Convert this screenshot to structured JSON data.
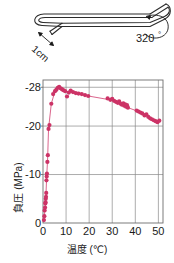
{
  "figure": {
    "schematic": {
      "name": "bent-capillary-tube-schematic",
      "length_label": "1cm",
      "angle_label": "320°",
      "outline_color": "#2b2b2b",
      "fill_color": "#fbfbfb"
    }
  },
  "chart_data": {
    "type": "scatter",
    "title": "",
    "xlabel": "温度 (℃)",
    "ylabel": "負圧 (MPa)",
    "xlim": [
      0,
      52
    ],
    "ylim": [
      0,
      -29.5
    ],
    "xticks": [
      0,
      10,
      20,
      30,
      40,
      50
    ],
    "xticklabels": [
      "0",
      "10",
      "20",
      "30",
      "40",
      "50"
    ],
    "yticks": [
      0,
      -10,
      -20,
      -28
    ],
    "yticklabels": [
      "0",
      "-10",
      "-20",
      "-28"
    ],
    "grid": true,
    "marker_color": "#cc3366",
    "line_color": "#d6547f",
    "series": [
      {
        "name": "負圧",
        "points": [
          [
            0.4,
            -0.6
          ],
          [
            0.6,
            -1.4
          ],
          [
            0.7,
            -2.6
          ],
          [
            0.9,
            -3.2
          ],
          [
            1.0,
            -4.0
          ],
          [
            1.1,
            -4.3
          ],
          [
            1.2,
            -5.0
          ],
          [
            1.3,
            -5.4
          ],
          [
            1.4,
            -6.2
          ],
          [
            1.5,
            -8.8
          ],
          [
            1.6,
            -9.6
          ],
          [
            1.7,
            -10.2
          ],
          [
            1.9,
            -12.6
          ],
          [
            2.1,
            -14.0
          ],
          [
            2.4,
            -19.4
          ],
          [
            2.8,
            -20.2
          ],
          [
            3.6,
            -24.6
          ],
          [
            4.4,
            -26.6
          ],
          [
            5.2,
            -27.2
          ],
          [
            5.8,
            -27.5
          ],
          [
            6.4,
            -27.9
          ],
          [
            7.0,
            -28.1
          ],
          [
            7.6,
            -27.8
          ],
          [
            8.2,
            -27.6
          ],
          [
            8.8,
            -27.4
          ],
          [
            9.6,
            -27.2
          ],
          [
            10.4,
            -26.1
          ],
          [
            11.2,
            -26.9
          ],
          [
            12.0,
            -27.3
          ],
          [
            13.0,
            -27.0
          ],
          [
            14.2,
            -26.8
          ],
          [
            15.4,
            -26.7
          ],
          [
            16.8,
            -26.6
          ],
          [
            18.2,
            -26.4
          ],
          [
            19.6,
            -26.2
          ],
          [
            28.0,
            -25.7
          ],
          [
            29.2,
            -25.4
          ],
          [
            30.0,
            -25.6
          ],
          [
            30.8,
            -25.2
          ],
          [
            31.6,
            -25.0
          ],
          [
            32.4,
            -24.8
          ],
          [
            33.0,
            -25.1
          ],
          [
            33.6,
            -24.6
          ],
          [
            34.2,
            -24.4
          ],
          [
            34.8,
            -24.7
          ],
          [
            35.2,
            -24.2
          ],
          [
            35.6,
            -24.5
          ],
          [
            36.0,
            -24.0
          ],
          [
            36.4,
            -24.3
          ],
          [
            36.8,
            -23.8
          ],
          [
            40.6,
            -23.2
          ],
          [
            41.4,
            -23.0
          ],
          [
            42.2,
            -22.8
          ],
          [
            43.0,
            -22.6
          ],
          [
            44.0,
            -22.2
          ],
          [
            44.8,
            -22.4
          ],
          [
            45.6,
            -21.9
          ],
          [
            46.4,
            -21.6
          ],
          [
            47.2,
            -21.4
          ],
          [
            48.0,
            -21.2
          ],
          [
            48.8,
            -21.0
          ],
          [
            49.6,
            -20.8
          ],
          [
            50.4,
            -21.1
          ]
        ],
        "line_path": [
          [
            0.5,
            -0.8
          ],
          [
            1.2,
            -5.0
          ],
          [
            1.6,
            -9.6
          ],
          [
            2.0,
            -13.2
          ],
          [
            2.4,
            -19.4
          ],
          [
            3.6,
            -24.6
          ],
          [
            5.2,
            -27.2
          ],
          [
            7.0,
            -28.1
          ],
          [
            9.6,
            -27.2
          ],
          [
            14.2,
            -26.8
          ],
          [
            19.6,
            -26.2
          ],
          [
            29.2,
            -25.4
          ],
          [
            34.2,
            -24.4
          ],
          [
            36.8,
            -23.8
          ],
          [
            41.4,
            -23.0
          ],
          [
            44.8,
            -22.4
          ],
          [
            48.0,
            -21.2
          ],
          [
            50.4,
            -21.1
          ]
        ]
      }
    ]
  }
}
